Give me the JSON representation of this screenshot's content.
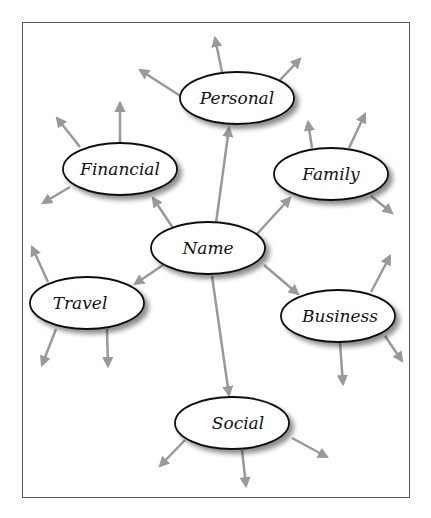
{
  "diagram": {
    "type": "mind-map",
    "colors": {
      "arrow": "#999999",
      "node_stroke": "#111111",
      "node_fill": "#ffffff",
      "frame": "#555555"
    },
    "center": {
      "id": "name",
      "label": "Name",
      "cx": 208,
      "cy": 248
    },
    "nodes": [
      {
        "id": "personal",
        "label": "Personal",
        "cx": 237,
        "cy": 98
      },
      {
        "id": "financial",
        "label": "Financial",
        "cx": 120,
        "cy": 169
      },
      {
        "id": "family",
        "label": "Family",
        "cx": 331,
        "cy": 174
      },
      {
        "id": "travel",
        "label": "Travel",
        "cx": 87,
        "cy": 303
      },
      {
        "id": "business",
        "label": "Business",
        "cx": 338,
        "cy": 316
      },
      {
        "id": "social",
        "label": "Social",
        "cx": 232,
        "cy": 423
      }
    ],
    "edges": [
      {
        "from": "name",
        "to": "personal"
      },
      {
        "from": "name",
        "to": "financial"
      },
      {
        "from": "name",
        "to": "family"
      },
      {
        "from": "name",
        "to": "travel"
      },
      {
        "from": "name",
        "to": "business"
      },
      {
        "from": "name",
        "to": "social"
      }
    ]
  }
}
